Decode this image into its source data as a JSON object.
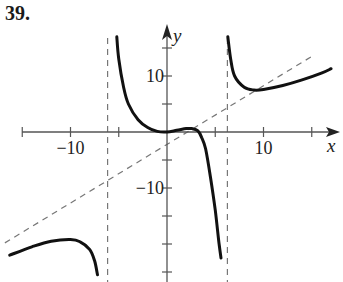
{
  "problem_label": "39.",
  "colors": {
    "curve": "#111111",
    "axis": "#555555",
    "asymptote": "#777777",
    "text": "#222222"
  },
  "chart_data": {
    "type": "line",
    "title": "",
    "xlabel": "x",
    "ylabel": "y",
    "xlim": [
      -15,
      18
    ],
    "ylim": [
      -25,
      17
    ],
    "grid": false,
    "x_ticks": [
      -15,
      -10,
      -5,
      5,
      10,
      15
    ],
    "y_ticks": [
      15,
      10,
      5,
      -5,
      -10,
      -15,
      -20,
      -25
    ],
    "x_tick_labels": [
      {
        "value": -10,
        "text": "−10"
      },
      {
        "value": 10,
        "text": "10"
      }
    ],
    "y_tick_labels": [
      {
        "value": 10,
        "text": "10"
      },
      {
        "value": -10,
        "text": "−10"
      }
    ],
    "asymptotes": {
      "vertical": [
        -6,
        6
      ],
      "slant": {
        "slope": 1,
        "intercept": -3,
        "style": "dashed"
      }
    },
    "series": [
      {
        "name": "left branch",
        "points": [
          [
            -16.3,
            -22
          ],
          [
            -14,
            -20.5
          ],
          [
            -12,
            -19.5
          ],
          [
            -10,
            -19.2
          ],
          [
            -9,
            -19.6
          ],
          [
            -8,
            -21
          ],
          [
            -7.5,
            -23
          ],
          [
            -7.2,
            -25.5
          ]
        ]
      },
      {
        "name": "middle branch",
        "points": [
          [
            -5.2,
            17
          ],
          [
            -5,
            13
          ],
          [
            -4.5,
            8
          ],
          [
            -4,
            5
          ],
          [
            -3,
            2.2
          ],
          [
            -2,
            0.8
          ],
          [
            -1,
            0.1
          ],
          [
            0,
            0
          ],
          [
            1,
            0.3
          ],
          [
            2,
            0.6
          ],
          [
            2.6,
            0.6
          ],
          [
            3.2,
            0.2
          ],
          [
            3.6,
            -1
          ],
          [
            4,
            -3
          ],
          [
            4.5,
            -8
          ],
          [
            5,
            -14
          ],
          [
            5.4,
            -20
          ],
          [
            5.6,
            -22.5
          ]
        ]
      },
      {
        "name": "right branch",
        "points": [
          [
            6.3,
            17
          ],
          [
            6.6,
            13
          ],
          [
            7,
            10
          ],
          [
            8,
            8
          ],
          [
            9,
            7.5
          ],
          [
            10,
            7.6
          ],
          [
            12,
            8.3
          ],
          [
            14,
            9.3
          ],
          [
            16,
            10.5
          ],
          [
            17,
            11.3
          ]
        ]
      }
    ]
  }
}
